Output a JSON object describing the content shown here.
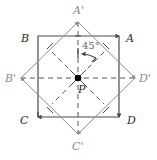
{
  "diagram": {
    "title": "",
    "colors": {
      "square": "#4a4a4a",
      "rotated_square": "#8c8c8c",
      "dashed": "#555555",
      "center_point": "#000000",
      "label_dark": "#2a2a2a",
      "label_grey": "#8a8a8a"
    },
    "square": {
      "vertices": {
        "A": {
          "label": "A",
          "x": 119,
          "y": 36
        },
        "B": {
          "label": "B",
          "x": 38,
          "y": 36
        },
        "C": {
          "label": "C",
          "x": 38,
          "y": 117
        },
        "D": {
          "label": "D",
          "x": 119,
          "y": 117
        }
      }
    },
    "rotated_square": {
      "vertices": {
        "A_prime": {
          "label": "A'",
          "x": 78,
          "y": 22
        },
        "B_prime": {
          "label": "B'",
          "x": 21,
          "y": 78
        },
        "C_prime": {
          "label": "C'",
          "x": 78,
          "y": 134
        },
        "D_prime": {
          "label": "D'",
          "x": 135,
          "y": 78
        }
      }
    },
    "center": {
      "label": "P",
      "x": 78,
      "y": 78
    },
    "rotation_angle": {
      "label": "45°",
      "value": 45
    }
  }
}
